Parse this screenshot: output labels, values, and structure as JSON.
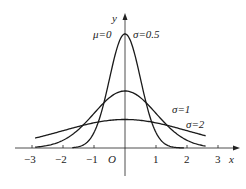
{
  "chart_data": {
    "type": "line",
    "title": "",
    "xlabel": "x",
    "ylabel": "y",
    "origin_label": "O",
    "xlim": [
      -3.3,
      3.7
    ],
    "x_ticks": [
      -3,
      -2,
      -1,
      1,
      2,
      3
    ],
    "x_tick_labels": [
      "-3",
      "-2",
      "-1",
      "1",
      "2",
      "3"
    ],
    "grid": false,
    "annotation_mu": "μ=0",
    "series": [
      {
        "name": "σ=0.5",
        "mu": 0,
        "sigma": 0.5,
        "x_range": [
          -1.7,
          1.9
        ],
        "peak": 0.798
      },
      {
        "name": "σ=1",
        "mu": 0,
        "sigma": 1,
        "x_range": [
          -2.9,
          2.6
        ],
        "peak": 0.399
      },
      {
        "name": "σ=2",
        "mu": 0,
        "sigma": 2,
        "x_range": [
          -2.9,
          2.6
        ],
        "peak": 0.199
      }
    ],
    "colors": {
      "axis": "#222222",
      "curve": "#1a1a1a"
    }
  }
}
